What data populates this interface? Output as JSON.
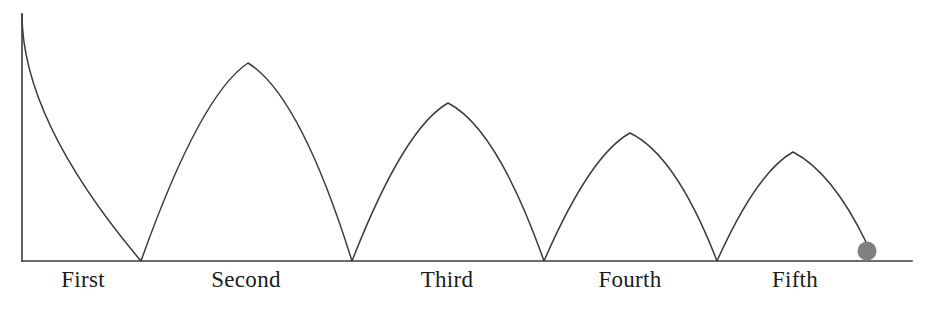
{
  "figure": {
    "background_color": "#ffffff",
    "line_color": "#3c3c3c",
    "label_color": "#1c1c1c",
    "ball_color": "#808080"
  },
  "labels": [
    {
      "text": "First",
      "x": 83,
      "y": 268
    },
    {
      "text": "Second",
      "x": 246,
      "y": 268
    },
    {
      "text": "Third",
      "x": 447,
      "y": 268
    },
    {
      "text": "Fourth",
      "x": 630,
      "y": 268
    },
    {
      "text": "Fifth",
      "x": 795,
      "y": 268
    }
  ],
  "chart_data": {
    "type": "line",
    "xlabel": "",
    "ylabel": "",
    "grid": false,
    "legend": null,
    "axes": {
      "baseline_y": 261,
      "y_axis_x": 22,
      "y_axis_top": 14,
      "baseline_x_start": 22,
      "baseline_x_end": 912
    },
    "categories": [
      "First",
      "Second",
      "Third",
      "Fourth",
      "Fifth"
    ],
    "release": {
      "x": 22,
      "y": 14,
      "height": 247
    },
    "bounce_points_x": [
      141,
      352,
      544,
      717,
      876
    ],
    "arc_peaks": [
      {
        "bounce": "Second",
        "x": 248,
        "y": 63,
        "height": 198
      },
      {
        "bounce": "Third",
        "x": 448,
        "y": 103,
        "height": 158
      },
      {
        "bounce": "Fourth",
        "x": 630,
        "y": 133,
        "height": 128
      },
      {
        "bounce": "Fifth",
        "x": 793,
        "y": 152,
        "height": 109
      }
    ],
    "peak_heights": [
      247,
      198,
      158,
      128,
      109
    ],
    "ball": {
      "cx": 867,
      "cy": 251,
      "r": 9.5,
      "color": "#808080"
    },
    "path_d": "M 22,14 Q 22,120 141,261 Q 200,95 248,63 Q 300,95 352,261 Q 404,128 448,103 Q 497,128 544,261 Q 590,155 630,133 Q 676,155 717,261 Q 757,172 793,152 Q 832,172 866,242"
  }
}
